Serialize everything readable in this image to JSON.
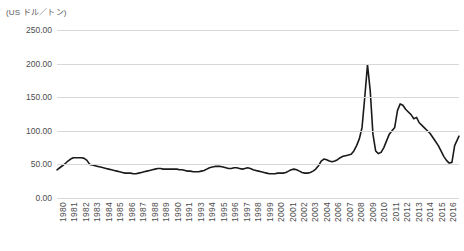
{
  "chart": {
    "unit_label": "(US ドル／トン)",
    "axis": {
      "y_ticks": [
        "0.00",
        "50.00",
        "100.00",
        "150.00",
        "200.00",
        "250.00"
      ],
      "x_ticks": [
        "1980",
        "1981",
        "1982",
        "1983",
        "1984",
        "1985",
        "1986",
        "1987",
        "1988",
        "1989",
        "1990",
        "1991",
        "1993",
        "1994",
        "1995",
        "1996",
        "1997",
        "1998",
        "1999",
        "2000",
        "2001",
        "2002",
        "2003",
        "2004",
        "2006",
        "2007",
        "2008",
        "2009",
        "2010",
        "2011",
        "2012",
        "2013",
        "2014",
        "2015",
        "2016"
      ]
    },
    "colors": {
      "line": "#1a1a1a",
      "grid": "#d8d8d6",
      "text": "#4d4d4d",
      "background": "#ffffff"
    }
  },
  "chart_data": {
    "type": "line",
    "title": "",
    "subtitle": "",
    "xlabel": "",
    "ylabel": "(US ドル／トン)",
    "ylim": [
      0,
      250
    ],
    "xlim": [
      1980,
      2016.9
    ],
    "grid": true,
    "legend": false,
    "y_tick_values": [
      0,
      50,
      100,
      150,
      200,
      250
    ],
    "x_tick_labels": [
      "1980",
      "1981",
      "1982",
      "1983",
      "1984",
      "1985",
      "1986",
      "1987",
      "1988",
      "1989",
      "1990",
      "1991",
      "1993",
      "1994",
      "1995",
      "1996",
      "1997",
      "1998",
      "1999",
      "2000",
      "2001",
      "2002",
      "2003",
      "2004",
      "2006",
      "2007",
      "2008",
      "2009",
      "2010",
      "2011",
      "2012",
      "2013",
      "2014",
      "2015",
      "2016"
    ],
    "series": [
      {
        "name": "価格",
        "x": [
          1980.0,
          1980.25,
          1980.5,
          1980.75,
          1981.0,
          1981.25,
          1981.5,
          1981.75,
          1982.0,
          1982.25,
          1982.5,
          1982.75,
          1983.0,
          1983.25,
          1983.5,
          1983.75,
          1984.0,
          1984.25,
          1984.5,
          1984.75,
          1985.0,
          1985.25,
          1985.5,
          1985.75,
          1986.0,
          1986.25,
          1986.5,
          1986.75,
          1987.0,
          1987.25,
          1987.5,
          1987.75,
          1988.0,
          1988.25,
          1988.5,
          1988.75,
          1989.0,
          1989.25,
          1989.5,
          1989.75,
          1990.0,
          1990.25,
          1990.5,
          1990.75,
          1991.0,
          1991.25,
          1991.5,
          1991.75,
          1992.0,
          1992.25,
          1992.5,
          1992.75,
          1993.0,
          1993.25,
          1993.5,
          1993.75,
          1994.0,
          1994.25,
          1994.5,
          1994.75,
          1995.0,
          1995.25,
          1995.5,
          1995.75,
          1996.0,
          1996.25,
          1996.5,
          1996.75,
          1997.0,
          1997.25,
          1997.5,
          1997.75,
          1998.0,
          1998.25,
          1998.5,
          1998.75,
          1999.0,
          1999.25,
          1999.5,
          1999.75,
          2000.0,
          2000.25,
          2000.5,
          2000.75,
          2001.0,
          2001.25,
          2001.5,
          2001.75,
          2002.0,
          2002.25,
          2002.5,
          2002.75,
          2003.0,
          2003.25,
          2003.5,
          2003.75,
          2004.0,
          2004.25,
          2004.5,
          2004.75,
          2005.0,
          2005.25,
          2005.5,
          2005.75,
          2006.0,
          2006.25,
          2006.5,
          2006.75,
          2007.0,
          2007.25,
          2007.5,
          2007.75,
          2008.0,
          2008.25,
          2008.5,
          2008.75,
          2009.0,
          2009.25,
          2009.5,
          2009.75,
          2010.0,
          2010.25,
          2010.5,
          2010.75,
          2011.0,
          2011.25,
          2011.5,
          2011.75,
          2012.0,
          2012.25,
          2012.5,
          2012.75,
          2013.0,
          2013.25,
          2013.5,
          2013.75,
          2014.0,
          2014.25,
          2014.5,
          2014.75,
          2015.0,
          2015.25,
          2015.5,
          2015.75,
          2016.0,
          2016.25,
          2016.5,
          2016.9
        ],
        "values": [
          42,
          45,
          48,
          51,
          55,
          58,
          60,
          60,
          60,
          60,
          59,
          56,
          50,
          49,
          48,
          47,
          46,
          45,
          44,
          43,
          42,
          41,
          40,
          39,
          38,
          37,
          37,
          37,
          36,
          36,
          37,
          38,
          39,
          40,
          41,
          42,
          43,
          44,
          44,
          43,
          43,
          43,
          43,
          43,
          43,
          42,
          42,
          41,
          40,
          40,
          39,
          39,
          39,
          40,
          41,
          43,
          45,
          46,
          47,
          47,
          47,
          46,
          45,
          44,
          44,
          45,
          45,
          44,
          43,
          44,
          45,
          44,
          42,
          41,
          40,
          39,
          38,
          37,
          36,
          36,
          36,
          37,
          37,
          37,
          38,
          40,
          42,
          43,
          42,
          40,
          38,
          37,
          37,
          38,
          40,
          43,
          48,
          55,
          58,
          57,
          55,
          54,
          55,
          57,
          60,
          62,
          63,
          64,
          65,
          70,
          78,
          88,
          105,
          150,
          198,
          160,
          95,
          70,
          66,
          68,
          75,
          85,
          95,
          100,
          105,
          130,
          140,
          138,
          132,
          128,
          124,
          118,
          120,
          112,
          108,
          104,
          100,
          96,
          90,
          84,
          78,
          70,
          62,
          56,
          52,
          53,
          78,
          92
        ]
      }
    ],
    "annotations": [
      {
        "label": "peak",
        "x": 2008.5,
        "y": 198
      },
      {
        "label": "secondary peak",
        "x": 2011.25,
        "y": 140
      },
      {
        "label": "trough",
        "x": 2015.75,
        "y": 52
      }
    ]
  }
}
